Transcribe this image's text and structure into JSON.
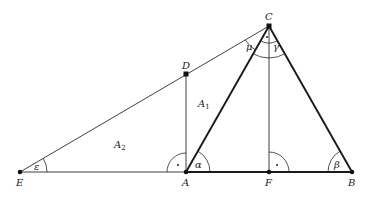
{
  "diagram": {
    "title": "",
    "points": {
      "E": {
        "label": "E",
        "x": 20,
        "y": 172
      },
      "A": {
        "label": "A",
        "x": 186,
        "y": 172
      },
      "F": {
        "label": "F",
        "x": 269,
        "y": 172
      },
      "B": {
        "label": "B",
        "x": 352,
        "y": 172
      },
      "C": {
        "label": "C",
        "x": 269,
        "y": 26
      },
      "D": {
        "label": "D",
        "x": 186,
        "y": 74
      }
    },
    "areas": {
      "A1": {
        "main": "A",
        "sub": "1"
      },
      "A2": {
        "main": "A",
        "sub": "2"
      }
    },
    "angles": {
      "epsilon": "ε",
      "alpha": "α",
      "beta": "β",
      "gamma": "γ",
      "mu": "μ",
      "right_angle_mark": "·"
    }
  }
}
